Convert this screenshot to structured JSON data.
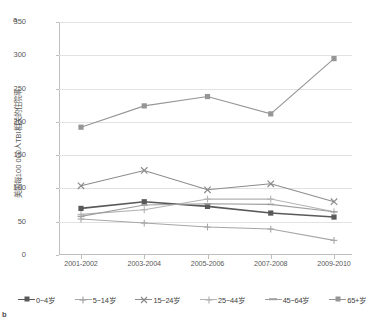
{
  "figure": {
    "panel_a_label": "a",
    "panel_b_label": "b"
  },
  "chart_data": {
    "type": "line",
    "title": "",
    "xlabel": "",
    "ylabel": "美国每100 000人TBI相关的住院率",
    "categories": [
      "2001-2002",
      "2003-2004",
      "2005-2006",
      "2007-2008",
      "2009-2010"
    ],
    "ylim": [
      0,
      350
    ],
    "ytick_step": 50,
    "yticks": [
      0,
      50,
      100,
      150,
      200,
      250,
      300,
      350
    ],
    "ytick_labels": [
      "0",
      "50",
      "100",
      "150",
      "200",
      "250",
      "300",
      "350"
    ],
    "grid": true,
    "legend_position": "bottom",
    "series": [
      {
        "name": "0~4岁",
        "marker": "square",
        "color": "#595959",
        "values": [
          70,
          80,
          73,
          63,
          57
        ]
      },
      {
        "name": "5~14岁",
        "marker": "plus",
        "color": "#a6a6a6",
        "values": [
          54,
          48,
          42,
          39,
          22
        ]
      },
      {
        "name": "15~24岁",
        "marker": "x",
        "color": "#8c8c8c",
        "values": [
          104,
          127,
          98,
          107,
          80
        ]
      },
      {
        "name": "25~44岁",
        "marker": "plus",
        "color": "#b3b3b3",
        "values": [
          61,
          68,
          84,
          84,
          65
        ]
      },
      {
        "name": "45~64岁",
        "marker": "dash",
        "color": "#9e9e9e",
        "values": [
          58,
          75,
          77,
          76,
          65
        ]
      },
      {
        "name": "65+岁",
        "marker": "square",
        "color": "#969696",
        "values": [
          192,
          224,
          238,
          212,
          295
        ]
      }
    ]
  }
}
